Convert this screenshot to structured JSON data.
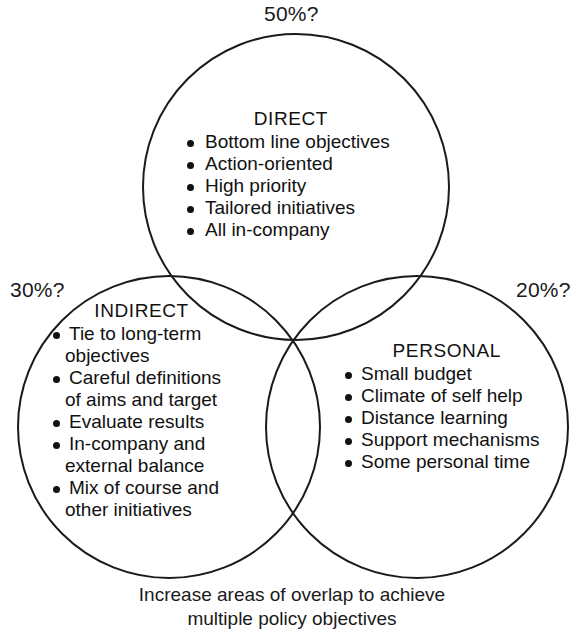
{
  "diagram": {
    "type": "venn-three-circle",
    "percent_labels": {
      "top": "50%?",
      "left": "30%?",
      "right": "20%?"
    },
    "groups": [
      {
        "id": "direct",
        "title": "DIRECT",
        "items": [
          "Bottom line objectives",
          "Action-oriented",
          "High priority",
          "Tailored initiatives",
          "All in-company"
        ]
      },
      {
        "id": "indirect",
        "title": "INDIRECT",
        "items": [
          {
            "line1": "Tie to long-term",
            "line2": "objectives"
          },
          {
            "line1": "Careful definitions",
            "line2": "of aims and target"
          },
          {
            "line1": "Evaluate results",
            "line2": ""
          },
          {
            "line1": "In-company and",
            "line2": "external balance"
          },
          {
            "line1": "Mix of course and",
            "line2": "other initiatives"
          }
        ]
      },
      {
        "id": "personal",
        "title": "PERSONAL",
        "items": [
          "Small budget",
          "Climate of self help",
          "Distance learning",
          "Support mechanisms",
          "Some personal time"
        ]
      }
    ],
    "caption": {
      "line1": "Increase areas of overlap to achieve",
      "line2": "multiple policy objectives"
    },
    "colors": {
      "stroke": "#1a1a1a",
      "text": "#111111",
      "background": "#ffffff"
    }
  }
}
